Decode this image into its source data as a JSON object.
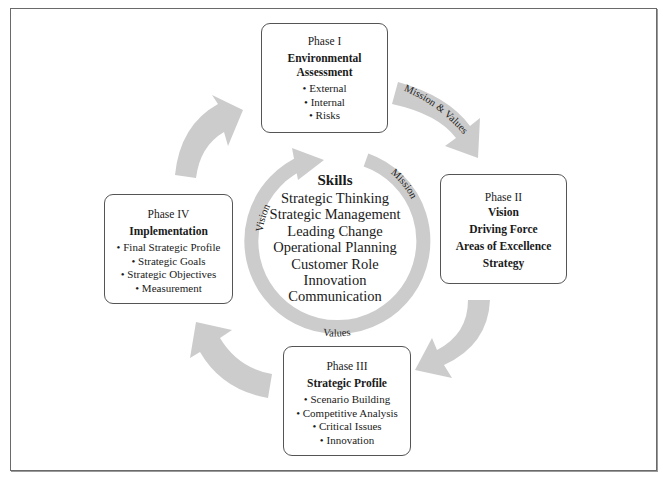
{
  "caption": "Figure: Strategic Planning Cycle",
  "center": {
    "title": "Skills",
    "items": [
      "Strategic Thinking",
      "Strategic Management",
      "Leading Change",
      "Operational Planning",
      "Customer Role",
      "Innovation",
      "Communication"
    ],
    "ring_labels": {
      "vision": "Vision",
      "mission": "Mission",
      "values": "Values"
    }
  },
  "arrows": {
    "phase1_to_phase2_label": "Mission & Values"
  },
  "phases": [
    {
      "phase": "Phase I",
      "title": "Environmental Assessment",
      "title_lines": [
        "Environmental",
        "Assessment"
      ],
      "items": [
        "External",
        "Internal",
        "Risks"
      ]
    },
    {
      "phase": "Phase II",
      "lines": [
        "Vision",
        "Driving Force",
        "Areas of Excellence",
        "Strategy"
      ]
    },
    {
      "phase": "Phase III",
      "title": "Strategic Profile",
      "items": [
        "Scenario Building",
        "Competitive Analysis",
        "Critical Issues",
        "Innovation"
      ]
    },
    {
      "phase": "Phase IV",
      "title": "Implementation",
      "items": [
        "Final Strategic Profile",
        "Strategic Goals",
        "Strategic Objectives",
        "Measurement"
      ]
    }
  ],
  "colors": {
    "arrow_fill": "#cccccc",
    "border": "#555555",
    "text": "#1a1a1a"
  }
}
